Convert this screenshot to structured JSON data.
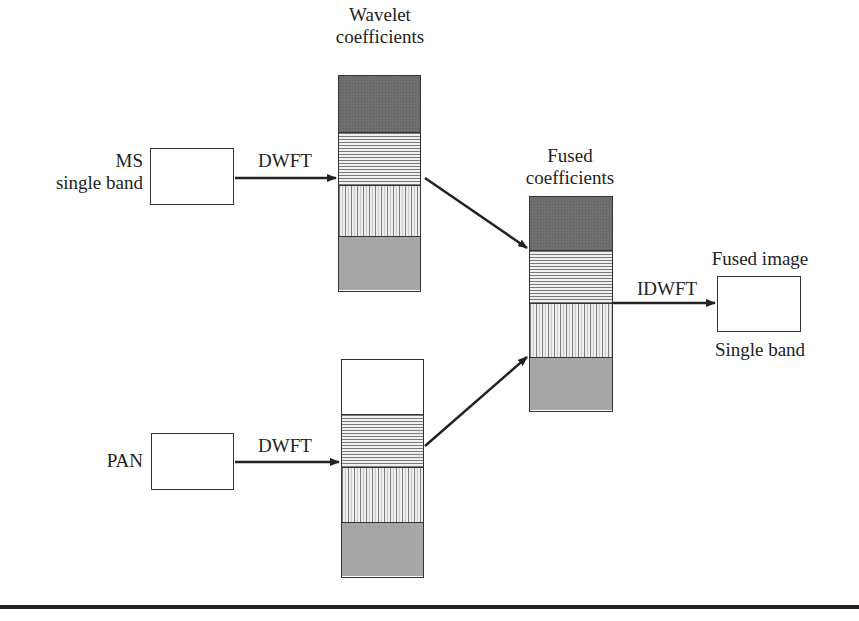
{
  "diagram": {
    "type": "wavelet-image-fusion-flow",
    "inputs": {
      "ms": {
        "label_line1": "MS",
        "label_line2": "single band"
      },
      "pan": {
        "label": "PAN"
      }
    },
    "transforms": {
      "forward_top": "DWFT",
      "forward_bottom": "DWFT",
      "inverse": "IDWFT"
    },
    "columns": {
      "wavelet": {
        "title_line1": "Wavelet",
        "title_line2": "coefficients",
        "segments": [
          "approximation",
          "horizontal-detail",
          "vertical-detail",
          "diagonal-detail"
        ]
      },
      "pan_coeffs": {
        "segments": [
          "empty",
          "horizontal-detail",
          "vertical-detail",
          "diagonal-detail"
        ]
      },
      "fused": {
        "title_line1": "Fused",
        "title_line2": "coefficients",
        "segments": [
          "approximation",
          "horizontal-detail",
          "vertical-detail",
          "diagonal-detail"
        ]
      }
    },
    "output": {
      "title": "Fused image",
      "subtitle": "Single band"
    },
    "colors": {
      "stroke": "#333333",
      "approximation_fill": "#6f6f6f",
      "diagonal_fill": "#bdbdbd",
      "rule": "#222222"
    }
  }
}
